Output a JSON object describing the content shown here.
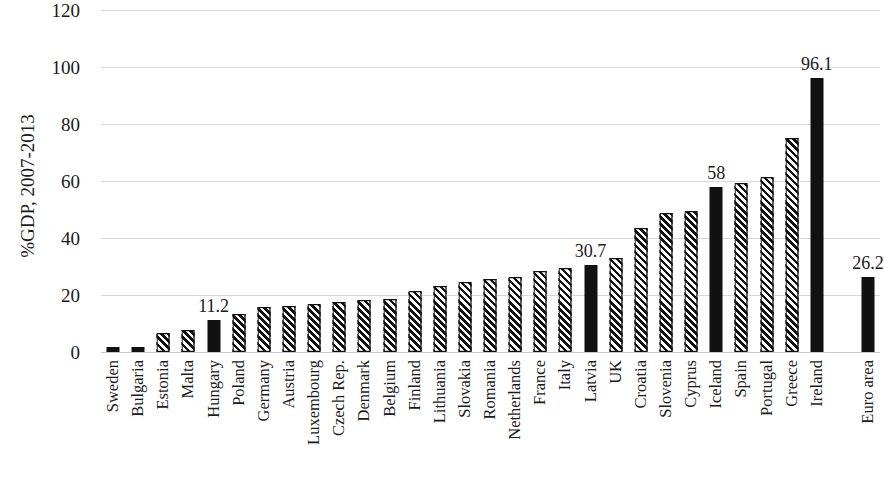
{
  "chart_data": {
    "type": "bar",
    "title": "",
    "xlabel": "",
    "ylabel": "%GDP, 2007-2013",
    "ylim": [
      0,
      120
    ],
    "yticks": [
      0,
      20,
      40,
      60,
      80,
      100,
      120
    ],
    "grid": true,
    "legend": null,
    "categories": [
      "Sweden",
      "Bulgaria",
      "Estonia",
      "Malta",
      "Hungary",
      "Poland",
      "Germany",
      "Austria",
      "Luxembourg",
      "Czech Rep.",
      "Denmark",
      "Belgium",
      "Finland",
      "Lithuania",
      "Slovakia",
      "Romania",
      "Netherlands",
      "France",
      "Italy",
      "Latvia",
      "UK",
      "Croatia",
      "Slovenia",
      "Cyprus",
      "Iceland",
      "Spain",
      "Portugal",
      "Greece",
      "Ireland",
      "Euro area"
    ],
    "values": [
      1.6,
      1.8,
      6.5,
      7.8,
      11.2,
      13.5,
      15.8,
      16.3,
      16.8,
      17.5,
      18.3,
      18.6,
      21.5,
      23.2,
      24.6,
      25.5,
      26.2,
      28.4,
      29.6,
      30.7,
      33.0,
      43.5,
      48.7,
      49.6,
      58.0,
      59.4,
      61.4,
      75.0,
      96.1,
      26.2
    ],
    "styles": [
      "solid",
      "solid",
      "hatched",
      "hatched",
      "solid",
      "hatched",
      "hatched",
      "hatched",
      "hatched",
      "hatched",
      "hatched",
      "hatched",
      "hatched",
      "hatched",
      "hatched",
      "hatched",
      "hatched",
      "hatched",
      "hatched",
      "solid",
      "hatched",
      "hatched",
      "hatched",
      "hatched",
      "solid",
      "hatched",
      "hatched",
      "hatched",
      "solid",
      "solid"
    ],
    "data_labels": [
      "",
      "",
      "",
      "",
      "11.2",
      "",
      "",
      "",
      "",
      "",
      "",
      "",
      "",
      "",
      "",
      "",
      "",
      "",
      "",
      "30.7",
      "",
      "",
      "",
      "",
      "58",
      "",
      "",
      "",
      "96.1",
      "26.2"
    ],
    "highlight_note": "Solid black bars are highlighted countries (Sweden, Bulgaria, Hungary, Latvia, Iceland, Ireland) and the Euro area aggregate; diagonally hatched bars are the remaining countries.",
    "colors": {
      "bar_fill": "#111111",
      "hatch_background": "#ffffff",
      "gridline": "#d8d8d8",
      "text": "#1a1a1a",
      "plot_background": "#ffffff"
    }
  }
}
